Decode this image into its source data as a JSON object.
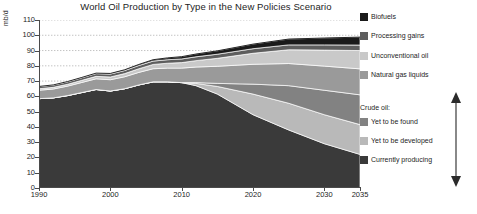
{
  "chart_data": {
    "type": "area",
    "title": "World Oil Production by Type in the New Policies Scenario",
    "xlabel": "",
    "ylabel": "mb/d",
    "ylim": [
      0,
      110
    ],
    "xlim": [
      1990,
      2035
    ],
    "grid": true,
    "stacked": true,
    "legend_position": "right",
    "yticks": [
      0,
      10,
      20,
      30,
      40,
      50,
      60,
      70,
      80,
      90,
      100,
      110
    ],
    "xticks": [
      1990,
      2000,
      2010,
      2020,
      2030,
      2035
    ],
    "x": [
      1990,
      1992,
      1994,
      1996,
      1998,
      2000,
      2002,
      2004,
      2006,
      2008,
      2010,
      2012,
      2015,
      2020,
      2025,
      2030,
      2035
    ],
    "series": [
      {
        "name": "Currently producing",
        "color": "#3a3a3a",
        "values": [
          58.5,
          59.0,
          60.5,
          62.5,
          64.5,
          63.5,
          65.0,
          67.5,
          69.5,
          69.5,
          69.0,
          67.0,
          61.5,
          48.0,
          38.0,
          29.0,
          22.0
        ]
      },
      {
        "name": "Yet to be developed",
        "color": "#b9b9b9",
        "values": [
          0,
          0,
          0,
          0,
          0,
          0,
          0,
          0,
          0,
          0,
          0,
          1.5,
          5.0,
          13.5,
          17.5,
          19.0,
          19.5
        ]
      },
      {
        "name": "Yet to be found",
        "color": "#828282",
        "values": [
          0,
          0,
          0,
          0,
          0,
          0,
          0,
          0,
          0,
          0,
          0,
          0.5,
          2.0,
          6.5,
          11.5,
          16.0,
          19.5
        ]
      },
      {
        "name": "Natural gas liquids",
        "color": "#9a9a9a",
        "values": [
          5.5,
          5.8,
          6.2,
          6.6,
          7.0,
          7.4,
          7.8,
          8.2,
          8.6,
          9.0,
          9.5,
          10.2,
          11.2,
          13.0,
          14.5,
          15.8,
          17.0
        ]
      },
      {
        "name": "Unconventional oil",
        "color": "#c9c9c9",
        "values": [
          1.0,
          1.1,
          1.2,
          1.4,
          1.6,
          1.8,
          2.1,
          2.4,
          2.8,
          3.2,
          3.6,
          4.2,
          5.2,
          7.2,
          9.0,
          10.5,
          12.0
        ]
      },
      {
        "name": "Processing gains",
        "color": "#5e5e5e",
        "values": [
          1.4,
          1.5,
          1.6,
          1.7,
          1.8,
          1.9,
          2.0,
          2.1,
          2.2,
          2.3,
          2.4,
          2.5,
          2.7,
          3.0,
          3.2,
          3.4,
          3.6
        ]
      },
      {
        "name": "Biofuels",
        "color": "#1a1a1a",
        "values": [
          0.1,
          0.1,
          0.2,
          0.2,
          0.3,
          0.4,
          0.5,
          0.7,
          0.9,
          1.2,
          1.5,
          1.8,
          2.2,
          3.0,
          3.8,
          4.5,
          5.2
        ]
      }
    ],
    "totals": [
      66.5,
      67.5,
      69.7,
      72.4,
      75.2,
      75.0,
      77.4,
      80.9,
      84.0,
      85.2,
      86.0,
      87.7,
      89.8,
      94.2,
      97.5,
      98.2,
      98.8
    ]
  },
  "legend_top": {
    "items": [
      {
        "label": "Biofuels",
        "color": "#1a1a1a"
      },
      {
        "label": "Processing gains",
        "color": "#5e5e5e"
      },
      {
        "label": "Unconventional oil",
        "color": "#c9c9c9"
      },
      {
        "label": "Natural gas liquids",
        "color": "#9a9a9a"
      }
    ]
  },
  "legend_bottom": {
    "title": "Crude oil:",
    "items": [
      {
        "label": "Yet to be found",
        "color": "#828282"
      },
      {
        "label": "Yet to be developed",
        "color": "#b9b9b9"
      },
      {
        "label": "Currently producing",
        "color": "#3a3a3a"
      }
    ]
  },
  "axis": {
    "y_unit": "mb/d"
  }
}
